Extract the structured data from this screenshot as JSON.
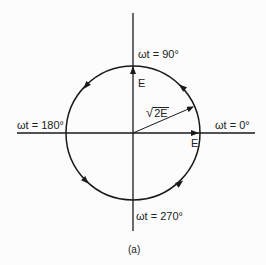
{
  "diagram": {
    "type": "phasor-circle",
    "caption": "(a)",
    "labels": {
      "top": "ωt = 90°",
      "right": "ωt = 0°",
      "left": "ωt = 180°",
      "bottom": "ωt = 270°",
      "vertical_phasor": "E",
      "horizontal_phasor": "E",
      "resultant_sqrt": "2E",
      "resultant_symbol": "√"
    },
    "rotation_direction": "counter-clockwise",
    "colors": {
      "stroke": "#1a1a1a",
      "text": "#222222",
      "background": "#fcfcfc"
    }
  }
}
